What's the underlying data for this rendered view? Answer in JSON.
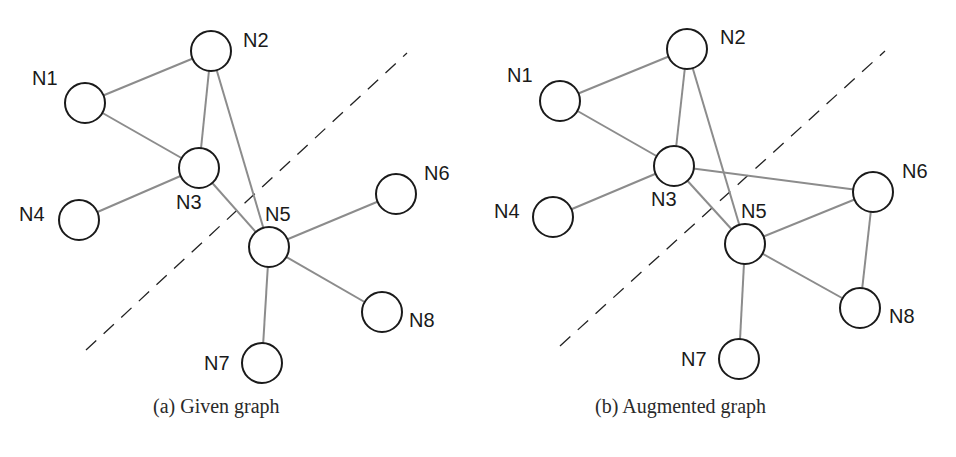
{
  "figure": {
    "panels": [
      {
        "id": "a",
        "caption": "(a) Given graph",
        "caption_pos": {
          "x": 153,
          "y": 395
        },
        "cut_line": {
          "x1": 86,
          "y1": 350,
          "x2": 407,
          "y2": 53
        },
        "nodes": [
          {
            "id": "N1",
            "label": "N1",
            "x": 85,
            "y": 103,
            "lx": 32,
            "ly": 85
          },
          {
            "id": "N2",
            "label": "N2",
            "x": 211,
            "y": 51,
            "lx": 243,
            "ly": 47
          },
          {
            "id": "N3",
            "label": "N3",
            "x": 199,
            "y": 168,
            "lx": 176,
            "ly": 209
          },
          {
            "id": "N4",
            "label": "N4",
            "x": 79,
            "y": 220,
            "lx": 19,
            "ly": 221
          },
          {
            "id": "N5",
            "label": "N5",
            "x": 269,
            "y": 247,
            "lx": 265,
            "ly": 221
          },
          {
            "id": "N6",
            "label": "N6",
            "x": 396,
            "y": 194,
            "lx": 424,
            "ly": 180
          },
          {
            "id": "N7",
            "label": "N7",
            "x": 262,
            "y": 363,
            "lx": 204,
            "ly": 370
          },
          {
            "id": "N8",
            "label": "N8",
            "x": 382,
            "y": 312,
            "lx": 409,
            "ly": 327
          }
        ],
        "edges": [
          [
            "N1",
            "N2"
          ],
          [
            "N1",
            "N3"
          ],
          [
            "N2",
            "N3"
          ],
          [
            "N2",
            "N5"
          ],
          [
            "N3",
            "N4"
          ],
          [
            "N3",
            "N5"
          ],
          [
            "N5",
            "N6"
          ],
          [
            "N5",
            "N7"
          ],
          [
            "N5",
            "N8"
          ]
        ]
      },
      {
        "id": "b",
        "caption": "(b) Augmented graph",
        "caption_pos": {
          "x": 595,
          "y": 395
        },
        "cut_line": {
          "x1": 560,
          "y1": 346,
          "x2": 885,
          "y2": 51
        },
        "nodes": [
          {
            "id": "N1",
            "label": "N1",
            "x": 560,
            "y": 101,
            "lx": 507,
            "ly": 82
          },
          {
            "id": "N2",
            "label": "N2",
            "x": 687,
            "y": 49,
            "lx": 720,
            "ly": 44
          },
          {
            "id": "N3",
            "label": "N3",
            "x": 674,
            "y": 166,
            "lx": 651,
            "ly": 206
          },
          {
            "id": "N4",
            "label": "N4",
            "x": 553,
            "y": 217,
            "lx": 494,
            "ly": 218
          },
          {
            "id": "N5",
            "label": "N5",
            "x": 745,
            "y": 244,
            "lx": 741,
            "ly": 218
          },
          {
            "id": "N6",
            "label": "N6",
            "x": 873,
            "y": 192,
            "lx": 902,
            "ly": 178
          },
          {
            "id": "N7",
            "label": "N7",
            "x": 739,
            "y": 359,
            "lx": 681,
            "ly": 366
          },
          {
            "id": "N8",
            "label": "N8",
            "x": 860,
            "y": 308,
            "lx": 889,
            "ly": 323
          }
        ],
        "edges": [
          [
            "N1",
            "N2"
          ],
          [
            "N1",
            "N3"
          ],
          [
            "N2",
            "N3"
          ],
          [
            "N2",
            "N5"
          ],
          [
            "N3",
            "N4"
          ],
          [
            "N3",
            "N5"
          ],
          [
            "N3",
            "N6"
          ],
          [
            "N5",
            "N6"
          ],
          [
            "N5",
            "N7"
          ],
          [
            "N5",
            "N8"
          ],
          [
            "N6",
            "N8"
          ]
        ]
      }
    ],
    "node_radius": 20,
    "colors": {
      "edge": "#8c8c8c",
      "node_stroke": "#1a1a1a",
      "cut_line": "#222222",
      "label": "#1a1a1a"
    }
  }
}
